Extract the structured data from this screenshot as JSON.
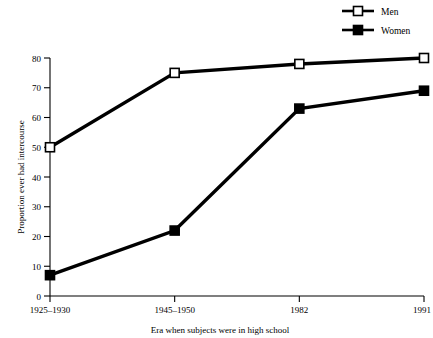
{
  "chart_data": {
    "type": "line",
    "title": "",
    "subtitle": "",
    "xlabel": "Era when subjects were in high school",
    "ylabel": "Proportion ever had intercourse",
    "categories": [
      "1925–1930",
      "1945–1950",
      "1982",
      "1991"
    ],
    "series": [
      {
        "name": "Men",
        "marker": "open-square",
        "values": [
          50,
          75,
          78,
          80
        ]
      },
      {
        "name": "Women",
        "marker": "filled-square",
        "values": [
          7,
          22,
          63,
          69
        ]
      }
    ],
    "ylim": [
      0,
      80
    ],
    "yticks": [
      0,
      10,
      20,
      30,
      40,
      50,
      60,
      70,
      80
    ],
    "ytick_labels": [
      "0",
      "10",
      "20",
      "30",
      "40",
      "50",
      "60",
      "70",
      "80"
    ],
    "grid": false,
    "legend_position": "top-right",
    "legend_entries": [
      "Men",
      "Women"
    ],
    "colors": {
      "line": "#000000",
      "marker_open_fill": "#ffffff",
      "marker_filled_fill": "#000000",
      "background": "#ffffff"
    }
  }
}
